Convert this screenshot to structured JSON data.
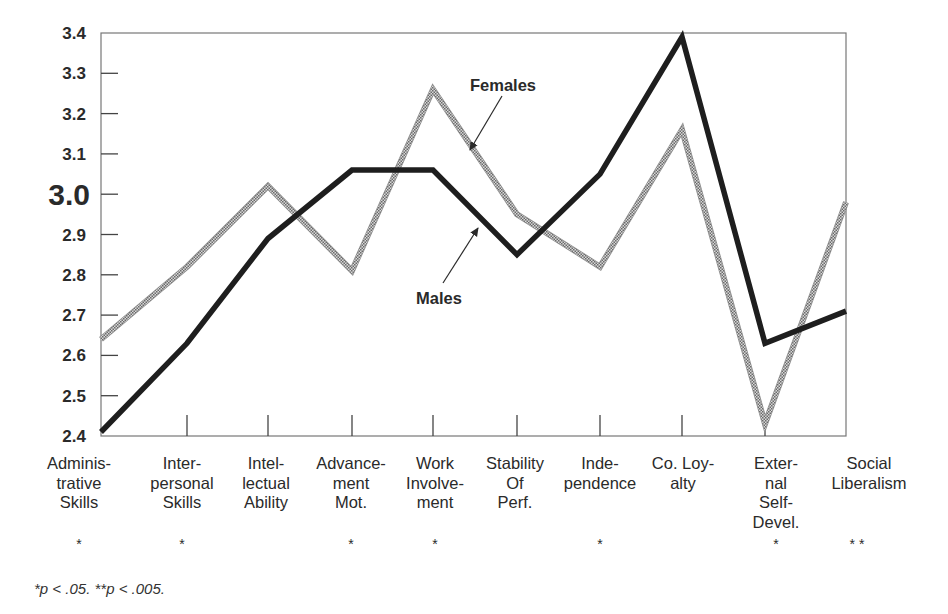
{
  "chart_data": {
    "type": "line",
    "title": "",
    "xlabel": "",
    "ylabel": "",
    "ylim": [
      2.4,
      3.4
    ],
    "grid": false,
    "legend_position": "inline annotations with arrows",
    "yticks": [
      "3.4",
      "3.3",
      "3.2",
      "3.1",
      "3.0",
      "2.9",
      "2.8",
      "2.7",
      "2.6",
      "2.5",
      "2.4"
    ],
    "categories": [
      [
        "Adminis-",
        "trative",
        "Skills"
      ],
      [
        "Inter-",
        "personal",
        "Skills"
      ],
      [
        "Intel-",
        "lectual",
        "Ability"
      ],
      [
        "Advance-",
        "ment",
        "Mot."
      ],
      [
        "Work",
        "Involve-",
        "ment"
      ],
      [
        "Stability",
        "Of",
        "Perf."
      ],
      [
        "Inde-",
        "pendence"
      ],
      [
        "Co. Loy-",
        "alty"
      ],
      [
        "Exter-",
        "nal",
        "Self-",
        "Devel."
      ],
      [
        "Social",
        "Liberalism"
      ]
    ],
    "significance": [
      "*",
      "*",
      "",
      "*",
      "*",
      "",
      "*",
      "",
      "*",
      "**"
    ],
    "series": [
      {
        "name": "Males",
        "style": "solid-thick-black",
        "color": "#1e1e1e",
        "values": [
          2.41,
          2.63,
          2.89,
          3.06,
          3.06,
          2.85,
          3.05,
          3.39,
          2.63,
          2.71
        ]
      },
      {
        "name": "Females",
        "style": "stippled-gray",
        "color": "#9a9a9a",
        "values": [
          2.64,
          2.82,
          3.02,
          2.81,
          3.26,
          2.95,
          2.82,
          3.16,
          2.43,
          2.98
        ]
      }
    ],
    "annotations": [
      {
        "text": "Females",
        "points_to": "Females"
      },
      {
        "text": "Males",
        "points_to": "Males"
      }
    ],
    "footnote": "*p < .05.   **p < .005."
  },
  "labels": {
    "females": "Females",
    "males": "Males",
    "footnote": "*p < .05.   **p < .005."
  }
}
